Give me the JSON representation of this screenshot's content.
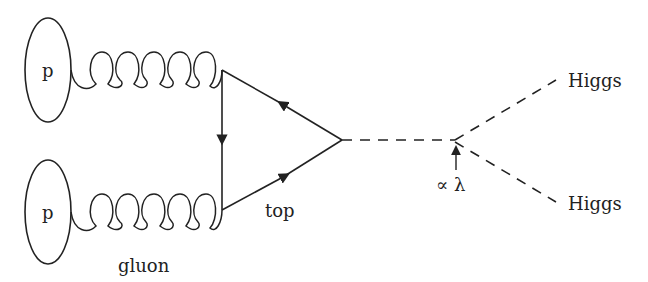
{
  "diagram": {
    "proton_top_label": "p",
    "proton_bottom_label": "p",
    "gluon_label": "gluon",
    "top_label": "top",
    "coupling_label": "∝ λ",
    "higgs_top_label": "Higgs",
    "higgs_bottom_label": "Higgs",
    "colors": {
      "line": "#222222",
      "background": "#ffffff"
    }
  }
}
